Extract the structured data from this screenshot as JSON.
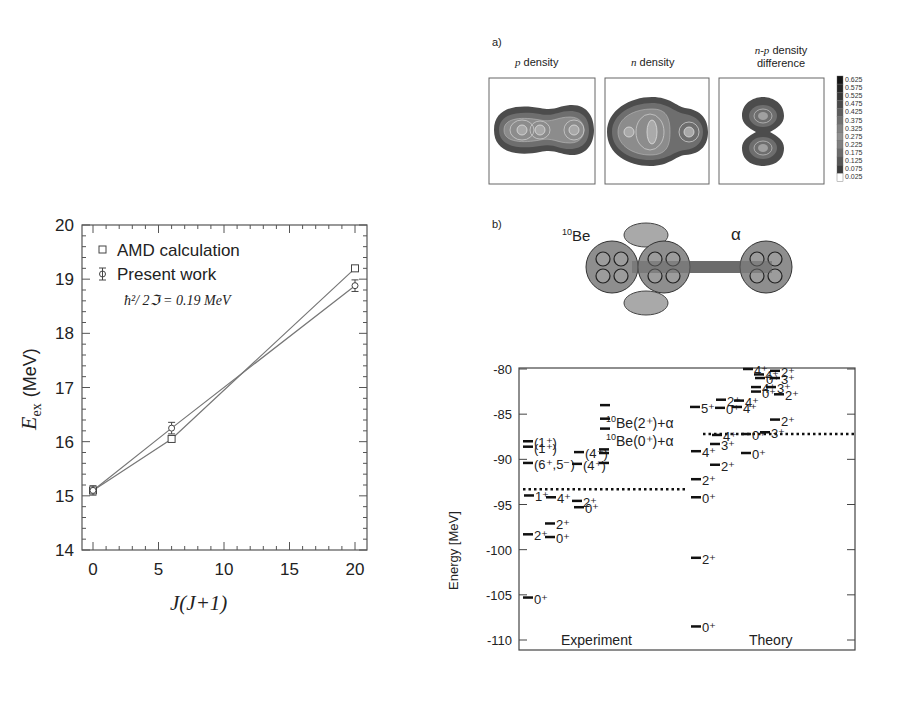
{
  "panel_a": {
    "label": "a)",
    "titles": [
      "p density",
      "n density",
      "n-p density",
      "difference"
    ],
    "title_italic_prefix": [
      "p",
      "n",
      "n-p"
    ],
    "colorbar": {
      "ticks": [
        "0.625",
        "0.575",
        "0.525",
        "0.475",
        "0.425",
        "0.375",
        "0.325",
        "0.275",
        "0.225",
        "0.175",
        "0.125",
        "0.075",
        "0.025"
      ]
    }
  },
  "panel_b": {
    "label": "b)",
    "left_label_sup": "10",
    "left_label": "Be",
    "right_label": "α"
  },
  "chart_data": [
    {
      "type": "line",
      "title": "",
      "xlabel": "J(J+1)",
      "ylabel": "E_ex (MeV)",
      "ylabel_main": "E",
      "ylabel_sub": "ex",
      "ylabel_unit": "(MeV)",
      "xlim": [
        -1,
        21
      ],
      "ylim": [
        14,
        20
      ],
      "xticks": [
        "0",
        "5",
        "10",
        "15",
        "20"
      ],
      "yticks": [
        "14",
        "15",
        "16",
        "17",
        "18",
        "19",
        "20"
      ],
      "grid": false,
      "legend_position": "upper-left",
      "annotation": "ħ²/ 2ℑ = 0.19 MeV",
      "x": [
        0,
        6,
        20
      ],
      "series": [
        {
          "name": "AMD calculation",
          "marker": "square",
          "values": [
            15.1,
            16.05,
            19.2
          ]
        },
        {
          "name": "Present work",
          "marker": "circle-errorbar",
          "values": [
            15.1,
            16.25,
            18.88
          ],
          "errors": [
            0.05,
            0.07,
            0.07
          ]
        }
      ]
    },
    {
      "type": "level-scheme",
      "ylabel": "Energy [MeV]",
      "ylim": [
        -111,
        -79
      ],
      "yticks": [
        "-80",
        "-85",
        "-90",
        "-95",
        "-100",
        "-105",
        "-110"
      ],
      "columns": [
        "Experiment",
        "Theory"
      ],
      "thresholds": [
        {
          "label_sup": "10",
          "label": "Be(2⁺)+α",
          "energy": null
        },
        {
          "label_sup": "10",
          "label": "Be(0⁺)+α",
          "energy": null
        }
      ],
      "threshold_lines": {
        "experiment": -93.3,
        "theory": -87.2
      },
      "experiment_levels": [
        {
          "energy": -105.3,
          "spin": "0⁺"
        },
        {
          "energy": -98.3,
          "spin": "2⁺"
        },
        {
          "energy": -98.6,
          "spin": "0⁺"
        },
        {
          "energy": -97.1,
          "spin": "2⁺"
        },
        {
          "energy": -94.0,
          "spin": "1⁺"
        },
        {
          "energy": -94.2,
          "spin": "4⁺"
        },
        {
          "energy": -94.6,
          "spin": "2⁺"
        },
        {
          "energy": -95.3,
          "spin": "0⁺"
        },
        {
          "energy": -90.4,
          "spin": "(6⁺,5⁻)"
        },
        {
          "energy": -90.5,
          "spin": "(4⁺)"
        },
        {
          "energy": -89.2,
          "spin": "(4⁺)"
        },
        {
          "energy": -88.6,
          "spin": "(1⁺)"
        },
        {
          "energy": -88.0,
          "spin": "(1⁺)"
        },
        {
          "energy": -84.0,
          "spin": ""
        },
        {
          "energy": -85.5,
          "spin": ""
        },
        {
          "energy": -86.6,
          "spin": ""
        },
        {
          "energy": -88.9,
          "spin": ""
        },
        {
          "energy": -89.3,
          "spin": ""
        },
        {
          "energy": -90.4,
          "spin": ""
        }
      ],
      "theory_levels": [
        {
          "energy": -108.5,
          "spin": "0⁺"
        },
        {
          "energy": -100.9,
          "spin": "2⁺"
        },
        {
          "energy": -94.2,
          "spin": "0⁺"
        },
        {
          "energy": -92.2,
          "spin": "2⁺"
        },
        {
          "energy": -90.6,
          "spin": "2⁺"
        },
        {
          "energy": -89.1,
          "spin": "4⁺"
        },
        {
          "energy": -88.3,
          "spin": "3⁺"
        },
        {
          "energy": -87.3,
          "spin": "4⁺"
        },
        {
          "energy": -89.3,
          "spin": "0⁺"
        },
        {
          "energy": -87.2,
          "spin": "0⁺"
        },
        {
          "energy": -87.0,
          "spin": "3⁺"
        },
        {
          "energy": -85.6,
          "spin": "2⁺"
        },
        {
          "energy": -84.2,
          "spin": "5⁺"
        },
        {
          "energy": -84.3,
          "spin": "0⁺"
        },
        {
          "energy": -83.4,
          "spin": "2⁺"
        },
        {
          "energy": -83.5,
          "spin": "4⁺"
        },
        {
          "energy": -84.2,
          "spin": "4⁺"
        },
        {
          "energy": -82.5,
          "spin": "0⁺"
        },
        {
          "energy": -82.0,
          "spin": "4⁺"
        },
        {
          "energy": -82.0,
          "spin": "3⁺"
        },
        {
          "energy": -82.8,
          "spin": "2⁺"
        },
        {
          "energy": -80.0,
          "spin": "4⁺"
        },
        {
          "energy": -80.6,
          "spin": "4⁺"
        },
        {
          "energy": -80.2,
          "spin": "2⁺"
        },
        {
          "energy": -81.0,
          "spin": "0⁺"
        },
        {
          "energy": -81.0,
          "spin": "3⁺"
        }
      ]
    }
  ]
}
